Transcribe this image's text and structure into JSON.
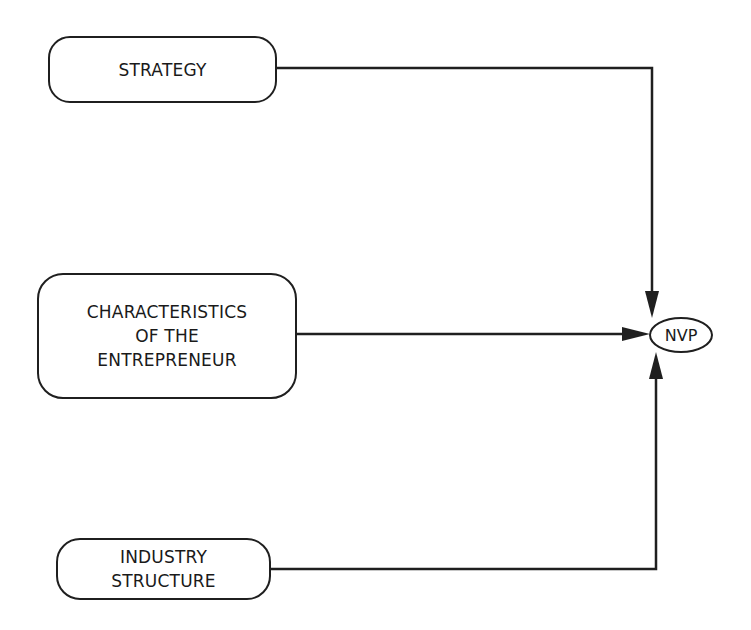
{
  "diagram": {
    "type": "flow",
    "nodes": [
      {
        "id": "strategy",
        "lines": [
          "STRATEGY"
        ]
      },
      {
        "id": "entrepreneur",
        "lines": [
          "CHARACTERISTICS",
          "OF THE",
          "ENTREPRENEUR"
        ]
      },
      {
        "id": "industry",
        "lines": [
          "INDUSTRY",
          "STRUCTURE"
        ]
      },
      {
        "id": "nvp",
        "lines": [
          "NVP"
        ]
      }
    ],
    "edges": [
      {
        "from": "strategy",
        "to": "nvp"
      },
      {
        "from": "entrepreneur",
        "to": "nvp"
      },
      {
        "from": "industry",
        "to": "nvp"
      }
    ],
    "colors": {
      "stroke": "#1f1f1f",
      "background": "#ffffff"
    }
  }
}
